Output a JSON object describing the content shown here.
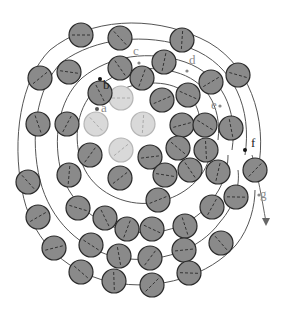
{
  "diagram": {
    "type": "concentric-spiral-particle-packing",
    "colors": {
      "dark_fill": "#8a8a8a",
      "light_fill": "#d9d9d9",
      "stroke_dark": "#2a2a2a",
      "stroke_light": "#b5b5b5",
      "path_line": "#555555",
      "label_dark": "#222222",
      "label_gray": "#8c8c8c"
    },
    "labels": [
      {
        "id": "a",
        "text": "a",
        "x": 101,
        "y": 101,
        "color": "#8c8c8c"
      },
      {
        "id": "b",
        "text": "b",
        "x": 103,
        "y": 78,
        "color": "#222222"
      },
      {
        "id": "c",
        "text": "c",
        "x": 133,
        "y": 44,
        "color": "#8c8c8c"
      },
      {
        "id": "d",
        "text": "d",
        "x": 189,
        "y": 53,
        "color": "#8c8c8c"
      },
      {
        "id": "e",
        "text": "e",
        "x": 211,
        "y": 98,
        "color": "#8c8c8c"
      },
      {
        "id": "f",
        "text": "f",
        "x": 251,
        "y": 136,
        "color": "#222222"
      },
      {
        "id": "g",
        "text": "g",
        "x": 260,
        "y": 187,
        "color": "#8c8c8c"
      }
    ],
    "light_circles": [
      [
        121,
        98
      ],
      [
        96,
        124
      ],
      [
        143,
        124
      ],
      [
        121,
        150
      ]
    ],
    "dark_circles": [
      [
        81,
        35
      ],
      [
        120,
        38
      ],
      [
        182,
        40
      ],
      [
        40,
        78
      ],
      [
        69,
        72
      ],
      [
        120,
        68
      ],
      [
        164,
        62
      ],
      [
        211,
        82
      ],
      [
        238,
        75
      ],
      [
        100,
        93
      ],
      [
        142,
        78
      ],
      [
        162,
        100
      ],
      [
        188,
        95
      ],
      [
        38,
        124
      ],
      [
        67,
        124
      ],
      [
        182,
        125
      ],
      [
        205,
        125
      ],
      [
        231,
        128
      ],
      [
        90,
        155
      ],
      [
        150,
        157
      ],
      [
        178,
        148
      ],
      [
        206,
        150
      ],
      [
        255,
        170
      ],
      [
        236,
        197
      ],
      [
        28,
        182
      ],
      [
        69,
        175
      ],
      [
        120,
        178
      ],
      [
        165,
        175
      ],
      [
        190,
        170
      ],
      [
        218,
        172
      ],
      [
        38,
        217
      ],
      [
        78,
        208
      ],
      [
        105,
        218
      ],
      [
        127,
        229
      ],
      [
        158,
        200
      ],
      [
        152,
        229
      ],
      [
        185,
        226
      ],
      [
        212,
        207
      ],
      [
        54,
        248
      ],
      [
        91,
        245
      ],
      [
        119,
        256
      ],
      [
        150,
        258
      ],
      [
        184,
        250
      ],
      [
        81,
        272
      ],
      [
        114,
        281
      ],
      [
        152,
        285
      ],
      [
        189,
        273
      ],
      [
        221,
        243
      ]
    ],
    "radius": 12
  }
}
